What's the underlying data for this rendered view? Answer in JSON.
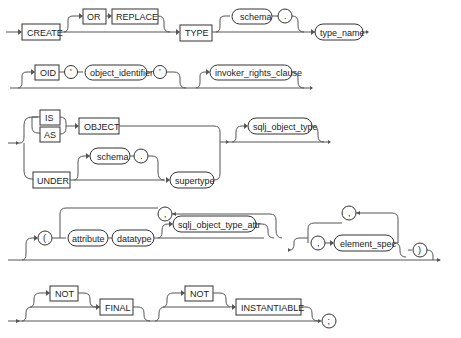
{
  "diagram": {
    "row1": {
      "create": "CREATE",
      "or": "OR",
      "replace": "REPLACE",
      "type": "TYPE",
      "schema": "schema",
      "dot": ".",
      "type_name": "type_name"
    },
    "row2": {
      "oid": "OID",
      "quote_open": "'",
      "object_identifier": "object_identifier",
      "quote_close": "'",
      "invoker_rights_clause": "invoker_rights_clause"
    },
    "row3": {
      "is": "IS",
      "as": "AS",
      "object": "OBJECT",
      "under": "UNDER",
      "schema": "schema",
      "dot": ".",
      "supertype": "supertype",
      "sqlj_object_type": "sqlj_object_type"
    },
    "row4": {
      "lparen": "(",
      "comma_loop": ",",
      "attribute": "attribute",
      "datatype": "datatype",
      "sqlj_object_type_attr": "sqlj_object_type_attr",
      "comma_loop2": ",",
      "comma": ",",
      "element_spec": "element_spec",
      "rparen": ")"
    },
    "row5": {
      "not1": "NOT",
      "final": "FINAL",
      "not2": "NOT",
      "instantiable": "INSTANTIABLE",
      "semicolon": ";"
    }
  }
}
